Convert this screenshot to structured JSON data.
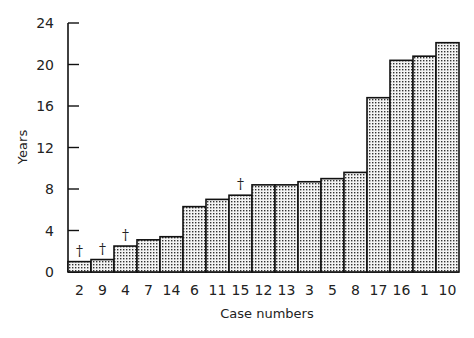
{
  "chart_data": {
    "type": "bar",
    "title": "",
    "xlabel": "Case numbers",
    "ylabel": "Years",
    "ylim": [
      0,
      24
    ],
    "yticks": [
      0,
      4,
      8,
      12,
      16,
      20,
      24
    ],
    "grid": false,
    "categories": [
      "2",
      "9",
      "4",
      "7",
      "14",
      "6",
      "11",
      "15",
      "12",
      "13",
      "3",
      "5",
      "8",
      "17",
      "16",
      "1",
      "10"
    ],
    "values": [
      1.0,
      1.2,
      2.5,
      3.1,
      3.4,
      6.3,
      7.0,
      7.4,
      8.4,
      8.4,
      8.7,
      9.0,
      9.6,
      16.8,
      20.4,
      20.8,
      22.1
    ],
    "annotations": [
      {
        "category": "2",
        "symbol": "†"
      },
      {
        "category": "9",
        "symbol": "†"
      },
      {
        "category": "4",
        "symbol": "†"
      },
      {
        "category": "15",
        "symbol": "†"
      }
    ],
    "fill_pattern": "stippled",
    "bar_edge_color": "#111111",
    "bar_fill_color": "#d8d8d8"
  }
}
